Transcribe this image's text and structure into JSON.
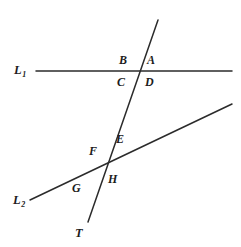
{
  "figure": {
    "canvas": {
      "width": 241,
      "height": 247,
      "background": "#ffffff"
    },
    "stroke_color": "#2b2b2b",
    "stroke_width": 1.5,
    "lines": [
      {
        "id": "L1",
        "label": "L",
        "subscript": "1",
        "kind": "straight-line",
        "x1": 36,
        "y1": 71,
        "x2": 232,
        "y2": 71,
        "label_x": 14,
        "label_y": 64
      },
      {
        "id": "L2",
        "label": "L",
        "subscript": "2",
        "kind": "straight-line",
        "x1": 30,
        "y1": 200,
        "x2": 232,
        "y2": 104,
        "label_x": 13,
        "label_y": 194
      },
      {
        "id": "T",
        "label": "T",
        "subscript": "",
        "kind": "transversal",
        "x1": 158,
        "y1": 20,
        "x2": 88,
        "y2": 222,
        "label_x": 75,
        "label_y": 227
      }
    ],
    "intersections": [
      {
        "id": "P1",
        "of": "L1 and T",
        "x": 137,
        "y": 71
      },
      {
        "id": "P2",
        "of": "L2 and T",
        "x": 104,
        "y": 163
      }
    ],
    "angle_labels": [
      {
        "name": "A",
        "text": "A",
        "x": 147,
        "y": 54,
        "at": "P1",
        "position": "upper-right"
      },
      {
        "name": "B",
        "text": "B",
        "x": 119,
        "y": 54,
        "at": "P1",
        "position": "upper-left"
      },
      {
        "name": "C",
        "text": "C",
        "x": 117,
        "y": 76,
        "at": "P1",
        "position": "lower-left"
      },
      {
        "name": "D",
        "text": "D",
        "x": 145,
        "y": 76,
        "at": "P1",
        "position": "lower-right"
      },
      {
        "name": "E",
        "text": "E",
        "x": 116,
        "y": 133,
        "at": "P2",
        "position": "upper-right"
      },
      {
        "name": "F",
        "text": "F",
        "x": 89,
        "y": 145,
        "at": "P2",
        "position": "upper-left"
      },
      {
        "name": "G",
        "text": "G",
        "x": 72,
        "y": 182,
        "at": "P2",
        "position": "lower-left"
      },
      {
        "name": "H",
        "text": "H",
        "x": 108,
        "y": 173,
        "at": "P2",
        "position": "lower-right"
      }
    ]
  }
}
